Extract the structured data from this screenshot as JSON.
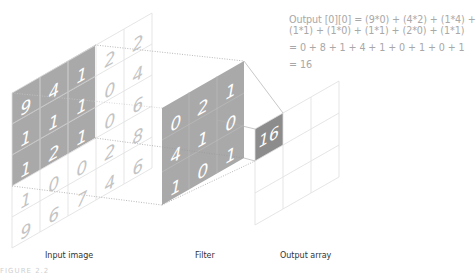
{
  "equation": {
    "line1": "Output [0][0] = (9*0) + (4*2) + (1*4) +",
    "line2": "(1*1) + (1*0) + (1*1) + (2*0) + (1*1)",
    "line3": "= 0 + 8 + 1 + 4 + 1 + 0 + 1 + 0 + 1",
    "line4": "= 16"
  },
  "labels": {
    "input": "Input image",
    "filter": "Filter",
    "output": "Output array"
  },
  "caption": "FIGURE 2.2",
  "input_image": {
    "rows": 5,
    "cols": 5,
    "values": [
      [
        "9",
        "4",
        "1",
        "2",
        "2"
      ],
      [
        "1",
        "1",
        "1",
        "0",
        "4"
      ],
      [
        "1",
        "2",
        "1",
        "0",
        "6"
      ],
      [
        "1",
        "0",
        "0",
        "2",
        "8"
      ],
      [
        "9",
        "6",
        "7",
        "4",
        "6"
      ]
    ],
    "highlight": "top-left 3x3"
  },
  "filter": {
    "values": [
      [
        "0",
        "2",
        "1"
      ],
      [
        "4",
        "1",
        "0"
      ],
      [
        "1",
        "0",
        "1"
      ]
    ]
  },
  "output_array": {
    "rows": 3,
    "cols": 3,
    "value_0_0": "16"
  },
  "colors": {
    "highlight_fill": "#a9a9a9",
    "output_fill": "#8c8c8c",
    "grid_line": "#dcdcdc",
    "light_digit": "#c4c4c4",
    "text": "#333333",
    "equation_text": "#a8a8a8"
  }
}
